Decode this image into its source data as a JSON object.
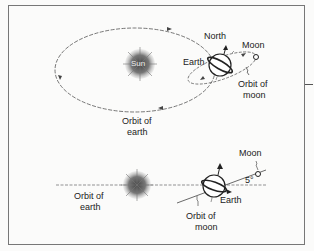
{
  "top_diagram": {
    "sun_label": "Sun",
    "earth_label": "Earth",
    "north_label": "North",
    "moon_label": "Moon",
    "orbit_moon_label_1": "Orbit of",
    "orbit_moon_label_2": "moon",
    "orbit_earth_label_1": "Orbit of",
    "orbit_earth_label_2": "earth"
  },
  "bottom_diagram": {
    "moon_label": "Moon",
    "angle_label": "5°",
    "earth_label": "Earth",
    "orbit_earth_label_1": "Orbit of",
    "orbit_earth_label_2": "earth",
    "orbit_moon_label_1": "Orbit of",
    "orbit_moon_label_2": "moon"
  },
  "colors": {
    "line": "#444444",
    "sun": "#555555"
  }
}
